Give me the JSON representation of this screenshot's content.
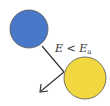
{
  "diagram": {
    "label": {
      "lhs": "E",
      "op": " < ",
      "rhs": "E",
      "rhs_sub": "a"
    },
    "colors": {
      "blue_particle": "#4a78c8",
      "yellow_particle": "#f2d840",
      "outline": "#555555",
      "arrow": "#333333"
    }
  }
}
